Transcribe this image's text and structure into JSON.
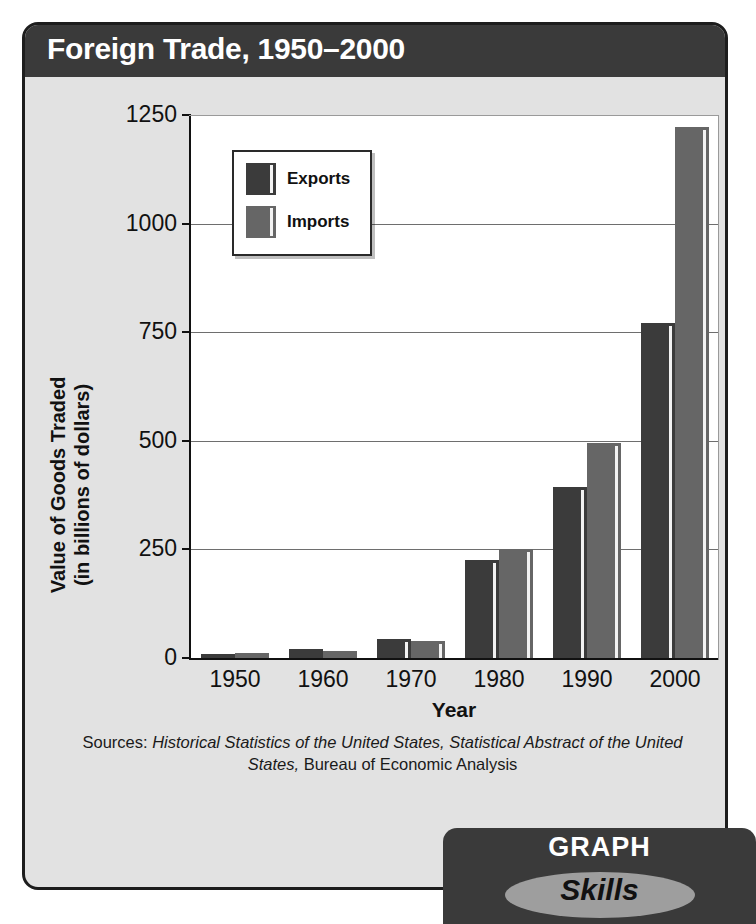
{
  "card": {
    "title": "Foreign Trade, 1950–2000"
  },
  "badge": {
    "line1": "GRAPH",
    "line2": "Skills"
  },
  "source": {
    "prefix": "Sources: ",
    "italic1": "Historical Statistics of the United States, Statistical Abstract of the United States,",
    "suffix": " Bureau of Economic Analysis"
  },
  "colors": {
    "exports": "#3b3b3b",
    "imports": "#666666",
    "title_bar": "#3a3a3a",
    "card_bg": "#e2e2e2",
    "plot_bg": "#ffffff",
    "gridline": "#6e6e6e"
  },
  "chart_data": {
    "type": "bar",
    "title": "Foreign Trade, 1950–2000",
    "xlabel": "Year",
    "ylabel": "Value of Goods Traded (in billions of dollars)",
    "ylabel_line1": "Value of  Goods Traded",
    "ylabel_line2": "(in billions of dollars)",
    "categories": [
      "1950",
      "1960",
      "1970",
      "1980",
      "1990",
      "2000"
    ],
    "series": [
      {
        "name": "Exports",
        "values": [
          10,
          20,
          43,
          225,
          393,
          772
        ]
      },
      {
        "name": "Imports",
        "values": [
          12,
          15,
          40,
          250,
          495,
          1222
        ]
      }
    ],
    "ylim": [
      0,
      1250
    ],
    "yticks": [
      "0",
      "250",
      "500",
      "750",
      "1000",
      "1250"
    ],
    "ytick_values": [
      0,
      250,
      500,
      750,
      1000,
      1250
    ],
    "grid": true,
    "legend": [
      "Exports",
      "Imports"
    ],
    "legend_position": "upper-left-inside"
  }
}
